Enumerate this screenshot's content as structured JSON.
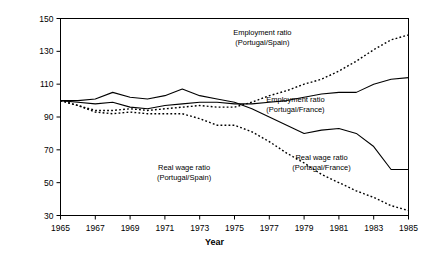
{
  "chart_data": {
    "type": "line",
    "title": "",
    "xlabel": "Year",
    "ylabel": "Ratio (1965 = 100)",
    "xlim": [
      1965,
      1985
    ],
    "ylim": [
      30,
      150
    ],
    "ytick_step": 20,
    "xtick_step": 2,
    "grid": false,
    "legend_position": "inline-annotations",
    "x": [
      1965,
      1966,
      1967,
      1968,
      1969,
      1970,
      1971,
      1972,
      1973,
      1974,
      1975,
      1976,
      1977,
      1978,
      1979,
      1980,
      1981,
      1982,
      1983,
      1984,
      1985
    ],
    "xticklabels": [
      "1965",
      "1967",
      "1969",
      "1971",
      "1973",
      "1975",
      "1977",
      "1979",
      "1981",
      "1983",
      "1985"
    ],
    "yticklabels": [
      "30",
      "50",
      "70",
      "90",
      "110",
      "130",
      "150"
    ],
    "series": [
      {
        "name": "Employment ratio (Portugal/Spain)",
        "style": "dotted",
        "values": [
          100,
          97,
          94,
          94,
          95,
          94,
          95,
          96,
          97,
          96,
          96,
          99,
          103,
          106,
          110,
          113,
          118,
          124,
          131,
          137,
          140
        ]
      },
      {
        "name": "Employment ratio (Portugal/France)",
        "style": "solid",
        "values": [
          100,
          99,
          98,
          99,
          96,
          95,
          97,
          98,
          99,
          99,
          98,
          98,
          99,
          100,
          102,
          104,
          105,
          105,
          110,
          113,
          114
        ]
      },
      {
        "name": "Real wage ratio (Portugal/France)",
        "style": "solid",
        "values": [
          100,
          100,
          101,
          105,
          102,
          101,
          103,
          107,
          103,
          101,
          99,
          95,
          90,
          85,
          80,
          82,
          83,
          80,
          72,
          58,
          58
        ]
      },
      {
        "name": "Real wage ratio (Portugal/Spain)",
        "style": "dotted",
        "values": [
          100,
          97,
          93,
          92,
          93,
          92,
          92,
          92,
          89,
          85,
          85,
          81,
          75,
          68,
          62,
          55,
          50,
          45,
          41,
          36,
          33
        ]
      }
    ],
    "annotations": [
      {
        "name": "employment-portugal-spain-label",
        "line1": "Employment ratio",
        "line2": "(Portugal/Spain)",
        "x": 1976.6,
        "y": 140
      },
      {
        "name": "employment-portugal-france-label",
        "line1": "Employment ratio",
        "line2": "(Portugal/France)",
        "x": 1978.5,
        "y": 99
      },
      {
        "name": "realwage-portugal-spain-label",
        "line1": "Real wage ratio",
        "line2": "(Portugal/Spain)",
        "x": 1972.1,
        "y": 58
      },
      {
        "name": "realwage-portugal-france-label",
        "line1": "Real wage ratio",
        "line2": "(Portugal/France)",
        "x": 1980.0,
        "y": 64
      }
    ],
    "colors": {
      "line": "#000000",
      "axis": "#000000",
      "background": "#ffffff"
    }
  }
}
